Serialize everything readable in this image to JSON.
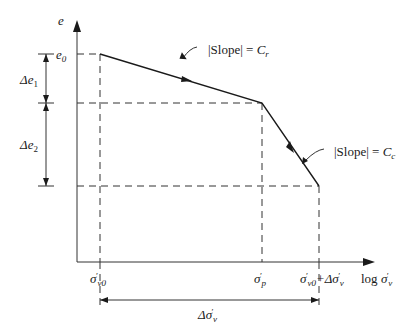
{
  "diagram": {
    "type": "consolidation e-log sigma' curve",
    "axes": {
      "y_label": "e",
      "x_label": "log σ'v"
    },
    "points": {
      "e0": "e0",
      "sigma_v0": "σ'v0",
      "sigma_p": "σ'p",
      "sigma_final": "σ'v0+Δσ'v"
    },
    "slopes": {
      "recompression": "|Slope| = Cr",
      "compression": "|Slope| = Cc"
    },
    "dimensions": {
      "delta_e1": "Δe1",
      "delta_e2": "Δe2",
      "delta_sigma": "Δσ'v"
    }
  },
  "labels": {
    "y_axis": "e",
    "x_axis_log": "log",
    "x_axis_sigma": "σ",
    "x_axis_sub": "v",
    "e0_base": "e",
    "e0_sub": "0",
    "de1_base": "Δe",
    "de1_sub": "1",
    "de2_base": "Δe",
    "de2_sub": "2",
    "sv0_base": "σ",
    "sv0_sub": "v0",
    "sp_base": "σ",
    "sp_sub": "p",
    "sf_base": "σ",
    "sf_sub": "v0",
    "sf_plus": "+Δσ",
    "sf_sub2": "v",
    "dsig_base": "Δσ",
    "dsig_sub": "v",
    "slope_cr_text": "|Slope| = ",
    "slope_cr_c": "C",
    "slope_cr_sub": "r",
    "slope_cc_text": "|Slope| = ",
    "slope_cc_c": "C",
    "slope_cc_sub": "c",
    "prime": "′"
  }
}
